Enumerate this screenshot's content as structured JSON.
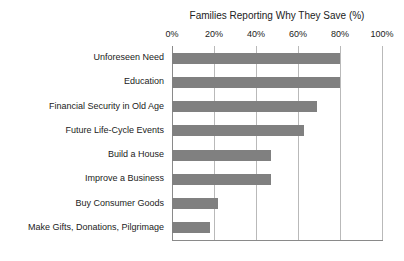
{
  "chart_data": {
    "type": "bar",
    "orientation": "horizontal",
    "title": "Families Reporting Why They Save (%)",
    "xlabel": "",
    "ylabel": "",
    "xlim": [
      0,
      100
    ],
    "grid": true,
    "legend": false,
    "categories": [
      "Unforeseen Need",
      "Education",
      "Financial Security in Old Age",
      "Future Life-Cycle Events",
      "Build a House",
      "Improve a Business",
      "Buy Consumer Goods",
      "Make Gifts, Donations, Pilgrimage"
    ],
    "values": [
      80,
      80,
      69,
      63,
      47,
      47,
      22,
      18
    ],
    "tick_labels": [
      "0%",
      "20%",
      "40%",
      "60%",
      "80%",
      "100%"
    ],
    "tick_values": [
      0,
      20,
      40,
      60,
      80,
      100
    ],
    "bar_color": "#808080",
    "gridline_color": "#b9b9b9",
    "axis_color": "#8a8a8a",
    "text_color": "#222222",
    "background_color": "#ffffff"
  }
}
